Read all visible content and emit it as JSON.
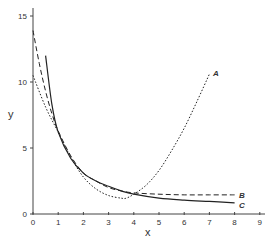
{
  "chart_data": {
    "type": "line",
    "title": "",
    "xlabel": "x",
    "ylabel": "y",
    "xlim": [
      0,
      9
    ],
    "ylim": [
      0,
      15.5
    ],
    "xticks": [
      0,
      1,
      2,
      3,
      4,
      5,
      6,
      7,
      8,
      9
    ],
    "yticks": [
      0,
      5,
      10,
      15
    ],
    "grid": false,
    "legend": "inline labels at line ends",
    "series": [
      {
        "name": "A",
        "style": "dotted",
        "x": [
          0,
          0.5,
          1,
          1.5,
          2,
          2.5,
          3,
          3.5,
          3.7,
          4,
          4.5,
          5,
          5.5,
          6,
          6.5,
          7
        ],
        "y": [
          10.5,
          8.1,
          6.2,
          4.3,
          2.8,
          1.9,
          1.4,
          1.2,
          1.2,
          1.5,
          2.2,
          3.3,
          4.8,
          6.5,
          8.5,
          10.6
        ]
      },
      {
        "name": "B",
        "style": "dashed",
        "x": [
          0,
          0.25,
          0.5,
          0.75,
          1,
          1.5,
          2,
          2.5,
          3,
          3.5,
          4,
          5,
          6,
          7,
          8
        ],
        "y": [
          13.9,
          11.4,
          9.3,
          7.6,
          6.3,
          4.4,
          3.1,
          2.5,
          2.0,
          1.75,
          1.6,
          1.5,
          1.45,
          1.45,
          1.45
        ]
      },
      {
        "name": "C",
        "style": "solid",
        "x": [
          0.5,
          0.75,
          1,
          1.5,
          2,
          2.5,
          3,
          3.5,
          4,
          5,
          6,
          7,
          8
        ],
        "y": [
          12.0,
          8.3,
          6.2,
          4.2,
          3.1,
          2.5,
          2.1,
          1.75,
          1.5,
          1.2,
          1.05,
          0.95,
          0.85
        ]
      }
    ]
  },
  "axes": {
    "x_label": "x",
    "y_label": "y",
    "x_tick_labels": [
      "0",
      "1",
      "2",
      "3",
      "4",
      "5",
      "6",
      "7",
      "8",
      "9"
    ],
    "y_tick_labels": [
      "0",
      "5",
      "10",
      "15"
    ]
  },
  "labels": {
    "A": "A",
    "B": "B",
    "C": "C"
  }
}
